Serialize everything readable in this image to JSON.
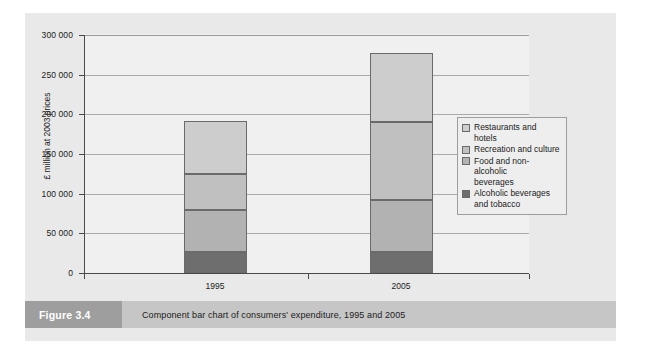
{
  "figure": {
    "number_label": "Figure 3.4",
    "caption": "Component bar chart of consumers' expenditure, 1995 and 2005"
  },
  "chart_data": {
    "type": "bar",
    "stacked": true,
    "title": "",
    "xlabel": "",
    "ylabel": "£ million at 2003 prices",
    "categories": [
      "1995",
      "2005"
    ],
    "ylim": [
      0,
      300000
    ],
    "ytick_values": [
      0,
      50000,
      100000,
      150000,
      200000,
      250000,
      300000
    ],
    "ytick_labels": [
      "0",
      "50 000",
      "100 000",
      "150 000",
      "200 000",
      "250 000",
      "300 000"
    ],
    "grid": true,
    "legend_position": "right",
    "series": [
      {
        "name": "Alcoholic beverages and tobacco",
        "legend_label": "Alcoholic beverages\nand tobacco",
        "color": "#6e6e6e",
        "values": [
          26000,
          27000
        ]
      },
      {
        "name": "Food and non-alcoholic beverages",
        "legend_label": "Food and non-alcoholic\nbeverages",
        "color": "#b2b2b2",
        "values": [
          54000,
          65000
        ]
      },
      {
        "name": "Recreation and culture",
        "legend_label": "Recreation and culture",
        "color": "#c0c0c0",
        "values": [
          45000,
          98000
        ]
      },
      {
        "name": "Restaurants and hotels",
        "legend_label": "Restaurants and hotels",
        "color": "#cdcdcd",
        "values": [
          67000,
          87000
        ]
      }
    ],
    "totals": [
      192000,
      277000
    ],
    "legend_entries": [
      {
        "label": "Restaurants and hotels",
        "color": "#cdcdcd"
      },
      {
        "label": "Recreation and culture",
        "color": "#c0c0c0"
      },
      {
        "label": "Food and non-alcoholic\nbeverages",
        "color": "#b2b2b2"
      },
      {
        "label": "Alcoholic beverages\nand tobacco",
        "color": "#6e6e6e"
      }
    ]
  }
}
